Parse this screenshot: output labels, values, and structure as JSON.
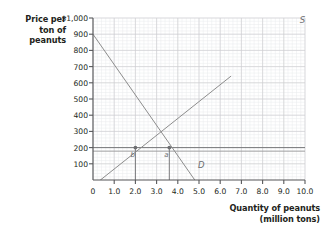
{
  "chart_data": {
    "type": "line",
    "title": "",
    "xlabel": "Quantity of peanuts (million tons)",
    "xlabel_line1": "Quantity of peanuts",
    "xlabel_line2": "(million tons)",
    "ylabel": "Price per ton of peanuts",
    "ylabel_line1": "Price per",
    "ylabel_line2": "ton of",
    "ylabel_line3": "peanuts",
    "xlim": [
      0,
      10
    ],
    "ylim": [
      0,
      1000
    ],
    "grid": true,
    "grid_minor_step_x": 0.2,
    "grid_minor_step_y": 20,
    "legend_position": "inline-curve-labels",
    "xticks": [
      {
        "value": 0,
        "label": "0"
      },
      {
        "value": 1,
        "label": "1.0"
      },
      {
        "value": 2,
        "label": "2.0"
      },
      {
        "value": 3,
        "label": "3.0"
      },
      {
        "value": 4,
        "label": "4.0"
      },
      {
        "value": 5,
        "label": "5.0"
      },
      {
        "value": 6,
        "label": "6.0"
      },
      {
        "value": 7,
        "label": "7.0"
      },
      {
        "value": 8,
        "label": "8.0"
      },
      {
        "value": 9,
        "label": "9.0"
      },
      {
        "value": 10,
        "label": "10.0"
      }
    ],
    "yticks": [
      {
        "value": 1000,
        "label": "$1,000"
      },
      {
        "value": 900,
        "label": "900"
      },
      {
        "value": 800,
        "label": "800"
      },
      {
        "value": 700,
        "label": "700"
      },
      {
        "value": 600,
        "label": "600"
      },
      {
        "value": 500,
        "label": "500"
      },
      {
        "value": 400,
        "label": "400"
      },
      {
        "value": 300,
        "label": "300"
      },
      {
        "value": 200,
        "label": "200"
      },
      {
        "value": 100,
        "label": "100"
      }
    ],
    "series": [
      {
        "name": "D",
        "label": "D",
        "type": "demand",
        "color": "#8c8c8c",
        "points": [
          [
            0,
            900
          ],
          [
            4.8,
            0
          ]
        ]
      },
      {
        "name": "S",
        "label": "S",
        "type": "supply",
        "color": "#8c8c8c",
        "points": [
          [
            0.35,
            0
          ],
          [
            6.5,
            640
          ]
        ]
      }
    ],
    "annotations": [
      {
        "name": "price-ceiling-line",
        "type": "hline",
        "y": 200,
        "x_from": 0,
        "x_to": 10,
        "color": "#6d6e71"
      },
      {
        "name": "secondary-hline",
        "type": "hline",
        "y": 178,
        "x_from": 0,
        "x_to": 10,
        "color": "#9a9a9a"
      },
      {
        "name": "quantity-supplied-marker",
        "type": "point",
        "x": 2.0,
        "y": 200,
        "label": "b",
        "color": "#6d6e71"
      },
      {
        "name": "quantity-demanded-marker",
        "type": "point",
        "x": 3.6,
        "y": 200,
        "label": "a",
        "color": "#6d6e71"
      },
      {
        "name": "quantity-supplied-dropline",
        "type": "vline",
        "x": 2.0,
        "y_from": 0,
        "y_to": 200
      },
      {
        "name": "quantity-demanded-dropline",
        "type": "vline",
        "x": 3.6,
        "y_from": 0,
        "y_to": 200
      }
    ],
    "curve_labels": [
      {
        "name": "supply-curve-label",
        "text": "S",
        "x": 9.75,
        "y": 985
      },
      {
        "name": "demand-curve-label",
        "text": "D",
        "x": 4.95,
        "y": 95
      }
    ]
  }
}
